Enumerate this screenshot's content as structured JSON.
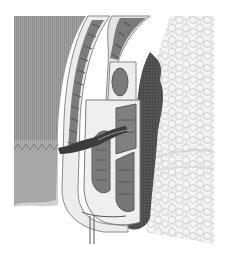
{
  "image": {
    "description": "Grayscale anatomical cross-section illustration of the anal canal with sphincter muscle layers, surrounding fat tissue and skin",
    "width": 228,
    "height": 258
  },
  "colors": {
    "background": "#ffffff",
    "skin": "#9a9a9a",
    "skin_light": "#c4c4c4",
    "muscle_band_bg": "#e8e8e8",
    "muscle_fiber": "#7a7a7a",
    "muscle_fiber_dark": "#5e5e5e",
    "mucosa_dark": "#3e3e3e",
    "fat": "#f2f2f2",
    "fat_outline": "#c8c8c8"
  }
}
